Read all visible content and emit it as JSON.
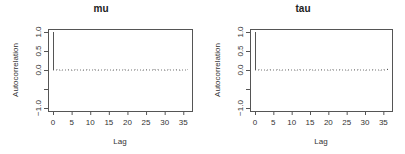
{
  "chart_data": [
    {
      "type": "bar",
      "title": "mu",
      "xlabel": "Lag",
      "ylabel": "Autocorrelation",
      "xlim": [
        0,
        36
      ],
      "ylim": [
        -1,
        1
      ],
      "xticks": [
        0,
        5,
        10,
        15,
        20,
        25,
        30,
        35
      ],
      "yticks": [
        -1.0,
        -0.5,
        0.0,
        0.5,
        1.0
      ],
      "ytick_labels": [
        "-1.0",
        "",
        "0.0",
        "0.5",
        "1.0"
      ],
      "x": [
        0,
        1,
        2,
        3,
        4,
        5,
        6,
        7,
        8,
        9,
        10,
        11,
        12,
        13,
        14,
        15,
        16,
        17,
        18,
        19,
        20,
        21,
        22,
        23,
        24,
        25,
        26,
        27,
        28,
        29,
        30,
        31,
        32,
        33,
        34,
        35,
        36
      ],
      "values": [
        1.0,
        0.01,
        -0.01,
        0.0,
        0.01,
        -0.01,
        0.01,
        0.0,
        -0.01,
        0.01,
        0.0,
        0.01,
        -0.01,
        0.0,
        0.01,
        0.0,
        -0.01,
        0.01,
        0.0,
        0.01,
        -0.01,
        0.0,
        0.01,
        0.0,
        -0.01,
        0.01,
        0.0,
        0.02,
        0.01,
        0.0,
        -0.01,
        0.01,
        0.0,
        0.01,
        -0.01,
        0.0,
        0.01
      ],
      "grid": false
    },
    {
      "type": "bar",
      "title": "tau",
      "xlabel": "Lag",
      "ylabel": "Autocorrelation",
      "xlim": [
        0,
        36
      ],
      "ylim": [
        -1,
        1
      ],
      "xticks": [
        0,
        5,
        10,
        15,
        20,
        25,
        30,
        35
      ],
      "yticks": [
        -1.0,
        -0.5,
        0.0,
        0.5,
        1.0
      ],
      "ytick_labels": [
        "-1.0",
        "",
        "0.0",
        "0.5",
        "1.0"
      ],
      "x": [
        0,
        1,
        2,
        3,
        4,
        5,
        6,
        7,
        8,
        9,
        10,
        11,
        12,
        13,
        14,
        15,
        16,
        17,
        18,
        19,
        20,
        21,
        22,
        23,
        24,
        25,
        26,
        27,
        28,
        29,
        30,
        31,
        32,
        33,
        34,
        35,
        36
      ],
      "values": [
        1.0,
        0.01,
        0.0,
        -0.01,
        0.01,
        0.0,
        0.01,
        -0.01,
        0.0,
        0.01,
        0.0,
        -0.01,
        0.01,
        0.0,
        0.0,
        0.01,
        -0.01,
        0.0,
        0.01,
        0.0,
        -0.01,
        0.01,
        0.0,
        0.01,
        0.0,
        -0.01,
        0.0,
        0.01,
        0.01,
        0.0,
        -0.01,
        0.0,
        0.01,
        0.0,
        -0.01,
        0.01,
        0.03
      ],
      "grid": false
    }
  ]
}
